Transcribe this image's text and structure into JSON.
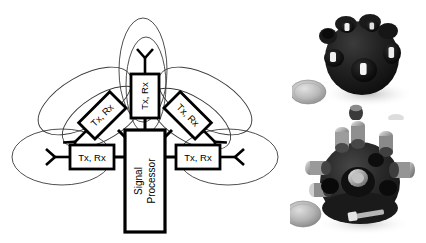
{
  "figure": {
    "name": "multi-transceiver-spherical-sensor-figure",
    "background_color": "#ffffff",
    "width": 426,
    "height": 243
  },
  "diagram": {
    "processor": {
      "label_line1": "Signal",
      "label_line2": "Processor",
      "rotation_deg": -90
    },
    "transceivers": [
      {
        "id": "top",
        "label": "Tx, Rx",
        "rotation_deg": -90,
        "beam_direction": "up"
      },
      {
        "id": "upper-left",
        "label": "Tx, Rx",
        "rotation_deg": -45,
        "beam_direction": "up-left"
      },
      {
        "id": "upper-right",
        "label": "Tx, Rx",
        "rotation_deg": 45,
        "beam_direction": "up-right"
      },
      {
        "id": "left",
        "label": "Tx, Rx",
        "rotation_deg": 0,
        "beam_direction": "left"
      },
      {
        "id": "right",
        "label": "Tx, Rx",
        "rotation_deg": 0,
        "beam_direction": "right"
      }
    ],
    "colors": {
      "line": "#000000",
      "beam": "#3a3a3a",
      "box_fill": "#ffffff"
    }
  },
  "photos": [
    {
      "id": "photo-top",
      "caption": "",
      "description": "Dark spherical multi-aperture sensor housing with open ports, coin at lower left for scale",
      "objects": [
        "spherical-sensor-housing",
        "scale-coin",
        "small-component"
      ]
    },
    {
      "id": "photo-bottom",
      "caption": "",
      "description": "Same spherical sensor housing populated with cylindrical transducer modules, coin at lower left for scale",
      "objects": [
        "spherical-sensor-housing-populated",
        "scale-coin",
        "bracket"
      ]
    }
  ]
}
